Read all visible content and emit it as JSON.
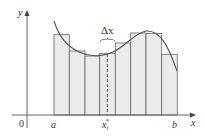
{
  "diagram": {
    "labels": {
      "y_axis": "y",
      "x_axis": "x",
      "origin": "0",
      "a": "a",
      "b": "b",
      "sample_point": "x",
      "sample_sub": "i",
      "sample_sup": "*",
      "delta": "Δx"
    },
    "colors": {
      "bar_fill": "#ebebeb",
      "bar_stroke": "#666666",
      "curve": "#555555",
      "axis": "#555555"
    },
    "bars": [
      {
        "x0": 54,
        "x1": 69.3,
        "top": 34.7
      },
      {
        "x0": 69.3,
        "x1": 85,
        "top": 51
      },
      {
        "x0": 85,
        "x1": 99.7,
        "top": 56
      },
      {
        "x0": 99.7,
        "x1": 115.3,
        "top": 53.3
      },
      {
        "x0": 115.3,
        "x1": 130.7,
        "top": 43
      },
      {
        "x0": 130.7,
        "x1": 146,
        "top": 33
      },
      {
        "x0": 146,
        "x1": 161.7,
        "top": 33.3
      },
      {
        "x0": 161.7,
        "x1": 177.3,
        "top": 54.3
      }
    ]
  }
}
